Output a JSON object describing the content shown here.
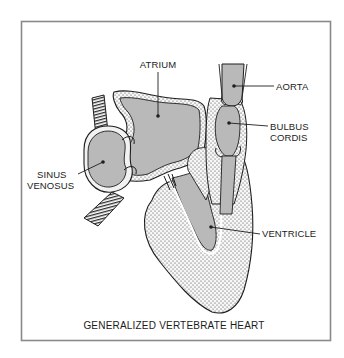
{
  "figure": {
    "caption": "GENERALIZED VERTEBRATE HEART",
    "labels": {
      "atrium": "ATRIUM",
      "aorta": "AORTA",
      "bulbus_line1": "BULBUS",
      "bulbus_line2": "CORDIS",
      "sinus_line1": "SINUS",
      "sinus_line2": "VENOSUS",
      "ventricle": "VENTRICLE"
    },
    "colors": {
      "chamber_fill": "#b9b9b9",
      "wall_fill": "#f2f2f2",
      "outline": "#1e1e1e",
      "frame": "#8a8a8a"
    }
  }
}
